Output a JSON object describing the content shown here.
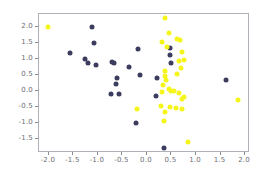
{
  "chart_data": {
    "type": "scatter",
    "title": "",
    "xlabel": "",
    "ylabel": "",
    "xlim": [
      -2.2,
      2.1
    ],
    "ylim": [
      -1.95,
      2.4
    ],
    "grid": false,
    "legend": "none",
    "xticks": [
      -2.0,
      -1.5,
      -1.0,
      -0.5,
      0.0,
      0.5,
      1.0,
      1.5,
      2.0
    ],
    "xticklabels": [
      "-2.0",
      "-1.5",
      "-1.0",
      "-0.5",
      "0.0",
      "0.5",
      "1.0",
      "1.5",
      "2.0"
    ],
    "yticks": [
      -1.5,
      -1.0,
      -0.5,
      0.0,
      0.5,
      1.0,
      1.5,
      2.0
    ],
    "yticklabels": [
      "-1.5",
      "-1.0",
      "-0.5",
      "0.0",
      "0.5",
      "1.0",
      "1.5",
      "2.0"
    ],
    "marker": "circle",
    "marker_size": 5,
    "series": [
      {
        "name": "class-0",
        "color": "#3c3c5e",
        "points": [
          [
            -1.57,
            1.17
          ],
          [
            -1.13,
            2.0
          ],
          [
            -1.07,
            1.5
          ],
          [
            -1.26,
            1.0
          ],
          [
            -1.2,
            0.86
          ],
          [
            -1.03,
            0.8
          ],
          [
            -0.72,
            0.89
          ],
          [
            -0.68,
            0.86
          ],
          [
            -0.36,
            0.75
          ],
          [
            -0.18,
            1.31
          ],
          [
            -0.62,
            0.4
          ],
          [
            -0.63,
            0.21
          ],
          [
            -0.14,
            0.48
          ],
          [
            -0.73,
            -0.1
          ],
          [
            -0.56,
            -0.11
          ],
          [
            -0.22,
            -1.02
          ],
          [
            0.21,
            0.4
          ],
          [
            0.19,
            -0.18
          ],
          [
            0.47,
            1.33
          ],
          [
            0.46,
            1.11
          ],
          [
            0.49,
            0.86
          ],
          [
            0.35,
            -1.8
          ],
          [
            1.62,
            0.32
          ]
        ]
      },
      {
        "name": "class-1",
        "color": "#f5f51c",
        "points": [
          [
            -2.01,
            2.0
          ],
          [
            0.36,
            2.27
          ],
          [
            0.44,
            1.82
          ],
          [
            0.31,
            1.53
          ],
          [
            0.62,
            1.62
          ],
          [
            0.67,
            1.58
          ],
          [
            0.41,
            1.38
          ],
          [
            0.72,
            1.21
          ],
          [
            0.76,
            0.97
          ],
          [
            0.66,
            0.92
          ],
          [
            0.7,
            0.7
          ],
          [
            0.36,
            0.62
          ],
          [
            0.36,
            0.47
          ],
          [
            0.39,
            0.33
          ],
          [
            0.33,
            0.18
          ],
          [
            0.44,
            0.04
          ],
          [
            0.55,
            -0.02
          ],
          [
            0.66,
            -0.06
          ],
          [
            0.75,
            -0.19
          ],
          [
            0.72,
            -0.27
          ],
          [
            0.31,
            -0.05
          ],
          [
            -0.21,
            -0.58
          ],
          [
            0.28,
            -0.48
          ],
          [
            0.46,
            -0.52
          ],
          [
            0.59,
            -0.55
          ],
          [
            0.71,
            -0.56
          ],
          [
            0.37,
            -0.67
          ],
          [
            0.34,
            -0.96
          ],
          [
            0.84,
            -1.62
          ],
          [
            1.85,
            -0.28
          ],
          [
            0.5,
            -0.02
          ],
          [
            0.61,
            0.52
          ]
        ]
      }
    ]
  }
}
